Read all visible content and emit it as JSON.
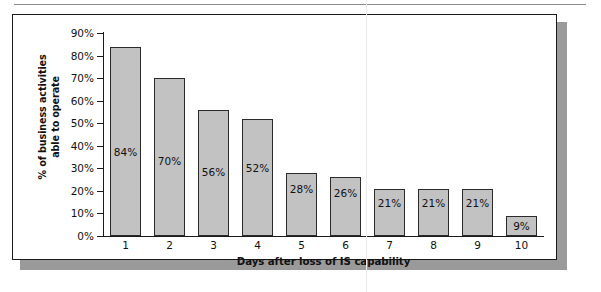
{
  "chart_data": {
    "type": "bar",
    "title": "",
    "subtitle": "",
    "xlabel": "Days after loss of IS capability",
    "ylabel": "% of business activities able to operate",
    "ylabel_lines": [
      "% of business activities",
      "able to operate"
    ],
    "categories": [
      "1",
      "2",
      "3",
      "4",
      "5",
      "6",
      "7",
      "8",
      "9",
      "10"
    ],
    "values": [
      84,
      70,
      56,
      52,
      28,
      26,
      21,
      21,
      21,
      9
    ],
    "data_labels": [
      "84%",
      "70%",
      "56%",
      "52%",
      "28%",
      "26%",
      "21%",
      "21%",
      "21%",
      "9%"
    ],
    "ylim": [
      0,
      90
    ],
    "ytick_values": [
      0,
      10,
      20,
      30,
      40,
      50,
      60,
      70,
      80,
      90
    ],
    "ytick_labels": [
      "0%",
      "10%",
      "20%",
      "30%",
      "40%",
      "50%",
      "60%",
      "70%",
      "80%",
      "90%"
    ],
    "grid": false,
    "legend": null,
    "legend_position": "none",
    "bar_fill_color": "#c2c2c2",
    "bar_border_color": "#2b2b2b",
    "axis_color": "#1a1a1a",
    "text_color": "#111111",
    "background_color": "#ffffff"
  }
}
